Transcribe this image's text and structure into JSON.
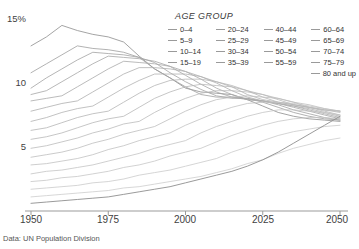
{
  "source_note": "Data: UN Population Division",
  "legend": {
    "title": "AGE GROUP",
    "columns": [
      [
        "0–4",
        "5–9",
        "10–14",
        "15–19"
      ],
      [
        "20–24",
        "25–29",
        "30–34",
        "35–39"
      ],
      [
        "40–44",
        "45–49",
        "50–54",
        "55–59"
      ],
      [
        "60–64",
        "65–69",
        "70–74",
        "75–79"
      ]
    ],
    "last": "80 and up"
  },
  "axes": {
    "y_ticks": [
      "15%",
      "10",
      "5"
    ],
    "x_ticks": [
      "1950",
      "1975",
      "2000",
      "2025",
      "2050"
    ]
  },
  "chart_data": {
    "type": "line",
    "title": "",
    "subtitle": "",
    "xlabel": "",
    "ylabel": "",
    "xlim": [
      1950,
      2050
    ],
    "ylim": [
      0,
      15
    ],
    "y_unit": "percent",
    "grid": false,
    "legend_position": "top-right",
    "annotations": [
      "Data: UN Population Division"
    ],
    "x": [
      1950,
      1955,
      1960,
      1965,
      1970,
      1975,
      1980,
      1985,
      1990,
      1995,
      2000,
      2005,
      2010,
      2015,
      2020,
      2025,
      2030,
      2035,
      2040,
      2045,
      2050
    ],
    "series": [
      {
        "name": "0–4",
        "color": "#9a9a9a",
        "values": [
          12.9,
          13.6,
          14.5,
          14.1,
          13.8,
          13.6,
          13.2,
          12.1,
          11.1,
          10.4,
          9.6,
          9.3,
          9.2,
          9.1,
          8.7,
          8.2,
          7.7,
          7.4,
          7.2,
          7.1,
          7.0
        ]
      },
      {
        "name": "5–9",
        "color": "#9e9e9e",
        "values": [
          10.8,
          11.5,
          12.2,
          12.9,
          12.7,
          12.6,
          12.4,
          12.0,
          11.1,
          10.4,
          9.7,
          9.1,
          8.9,
          8.9,
          8.8,
          8.5,
          8.1,
          7.7,
          7.4,
          7.2,
          7.1
        ]
      },
      {
        "name": "10–14",
        "color": "#a2a2a2",
        "values": [
          9.6,
          10.4,
          11.1,
          11.8,
          12.4,
          12.3,
          12.2,
          12.0,
          11.6,
          10.8,
          10.1,
          9.5,
          9.0,
          8.8,
          8.8,
          8.6,
          8.3,
          7.9,
          7.6,
          7.3,
          7.1
        ]
      },
      {
        "name": "15–19",
        "color": "#a6a6a6",
        "values": [
          9.1,
          9.4,
          10.1,
          10.8,
          11.5,
          12.1,
          12.0,
          11.9,
          11.7,
          11.3,
          10.6,
          9.9,
          9.3,
          8.9,
          8.7,
          8.6,
          8.4,
          8.1,
          7.8,
          7.5,
          7.2
        ]
      },
      {
        "name": "20–24",
        "color": "#aaaaaa",
        "values": [
          8.6,
          8.8,
          9.0,
          9.7,
          10.4,
          11.1,
          11.7,
          11.6,
          11.5,
          11.3,
          10.9,
          10.3,
          9.6,
          9.1,
          8.7,
          8.6,
          8.4,
          8.2,
          7.9,
          7.6,
          7.3
        ]
      },
      {
        "name": "25–29",
        "color": "#aeaeae",
        "values": [
          7.8,
          8.1,
          8.4,
          8.6,
          9.3,
          10.0,
          10.7,
          11.2,
          11.2,
          11.1,
          10.9,
          10.5,
          10.0,
          9.4,
          8.9,
          8.6,
          8.4,
          8.2,
          8.0,
          7.7,
          7.4
        ]
      },
      {
        "name": "30–34",
        "color": "#b2b2b2",
        "values": [
          7.0,
          7.3,
          7.7,
          8.0,
          8.2,
          8.9,
          9.6,
          10.2,
          10.7,
          10.7,
          10.7,
          10.5,
          10.1,
          9.7,
          9.1,
          8.7,
          8.5,
          8.3,
          8.1,
          7.8,
          7.5
        ]
      },
      {
        "name": "35–39",
        "color": "#b5b5b5",
        "values": [
          6.3,
          6.5,
          6.9,
          7.3,
          7.6,
          7.8,
          8.5,
          9.2,
          9.8,
          10.2,
          10.3,
          10.3,
          10.1,
          9.8,
          9.4,
          8.9,
          8.5,
          8.3,
          8.1,
          7.9,
          7.7
        ]
      },
      {
        "name": "40–44",
        "color": "#b8b8b8",
        "values": [
          5.6,
          5.8,
          6.1,
          6.5,
          6.9,
          7.2,
          7.4,
          8.1,
          8.8,
          9.3,
          9.7,
          9.9,
          9.8,
          9.7,
          9.4,
          9.1,
          8.7,
          8.3,
          8.1,
          7.9,
          7.8
        ]
      },
      {
        "name": "45–49",
        "color": "#bbbbbb",
        "values": [
          4.9,
          5.1,
          5.4,
          5.7,
          6.1,
          6.4,
          6.8,
          7.0,
          7.7,
          8.3,
          8.8,
          9.2,
          9.4,
          9.4,
          9.3,
          9.1,
          8.8,
          8.5,
          8.1,
          7.9,
          7.8
        ]
      },
      {
        "name": "50–54",
        "color": "#bebebe",
        "values": [
          4.2,
          4.4,
          4.6,
          4.9,
          5.3,
          5.6,
          6.0,
          6.3,
          6.6,
          7.2,
          7.8,
          8.3,
          8.7,
          8.9,
          9.0,
          8.9,
          8.8,
          8.5,
          8.3,
          8.0,
          7.8
        ]
      },
      {
        "name": "55–59",
        "color": "#c1c1c1",
        "values": [
          3.6,
          3.7,
          3.9,
          4.1,
          4.4,
          4.8,
          5.1,
          5.5,
          5.8,
          6.1,
          6.7,
          7.2,
          7.7,
          8.1,
          8.4,
          8.5,
          8.5,
          8.4,
          8.2,
          8.0,
          7.8
        ]
      },
      {
        "name": "60–64",
        "color": "#c4c4c4",
        "values": [
          2.9,
          3.1,
          3.2,
          3.4,
          3.6,
          3.9,
          4.2,
          4.5,
          4.9,
          5.2,
          5.5,
          6.1,
          6.6,
          7.0,
          7.4,
          7.7,
          7.9,
          7.9,
          7.8,
          7.7,
          7.5
        ]
      },
      {
        "name": "65–69",
        "color": "#c7c7c7",
        "values": [
          2.3,
          2.4,
          2.6,
          2.7,
          2.9,
          3.1,
          3.4,
          3.6,
          3.9,
          4.3,
          4.6,
          4.9,
          5.4,
          5.9,
          6.3,
          6.7,
          7.0,
          7.2,
          7.3,
          7.3,
          7.2
        ]
      },
      {
        "name": "70–74",
        "color": "#cacaca",
        "values": [
          1.7,
          1.8,
          1.9,
          2.0,
          2.2,
          2.3,
          2.5,
          2.8,
          3.0,
          3.2,
          3.5,
          3.8,
          4.1,
          4.6,
          5.0,
          5.5,
          5.9,
          6.2,
          6.4,
          6.6,
          6.7
        ]
      },
      {
        "name": "75–79",
        "color": "#cdcdcd",
        "values": [
          1.1,
          1.2,
          1.3,
          1.4,
          1.5,
          1.6,
          1.8,
          1.9,
          2.1,
          2.3,
          2.5,
          2.7,
          3.0,
          3.3,
          3.7,
          4.0,
          4.5,
          4.9,
          5.2,
          5.5,
          5.7
        ]
      },
      {
        "name": "80 and up",
        "color": "#8e8e8e",
        "values": [
          0.6,
          0.7,
          0.8,
          0.9,
          1.0,
          1.1,
          1.3,
          1.5,
          1.7,
          1.9,
          2.2,
          2.5,
          2.8,
          3.1,
          3.5,
          4.0,
          4.6,
          5.3,
          6.0,
          6.7,
          7.4
        ]
      }
    ]
  }
}
